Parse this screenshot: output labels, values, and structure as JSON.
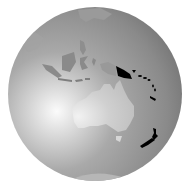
{
  "map": {
    "type": "orthographic-globe-locator",
    "colors": {
      "background": "#ffffff",
      "ocean_light": "#f4f4f4",
      "ocean_mid": "#a8a8a8",
      "ocean_dark": "#6e6e6e",
      "land": "#cfcfcf",
      "land_other": "#8c8c8c",
      "highlight": "#000000"
    },
    "highlighted_regions": [
      "papua-new-guinea",
      "solomon-islands",
      "vanuatu",
      "new-caledonia",
      "new-zealand"
    ],
    "visible_landmasses": [
      "australia",
      "tasmania",
      "indonesia",
      "philippines",
      "southeast-asia",
      "antarctica-edge"
    ]
  }
}
